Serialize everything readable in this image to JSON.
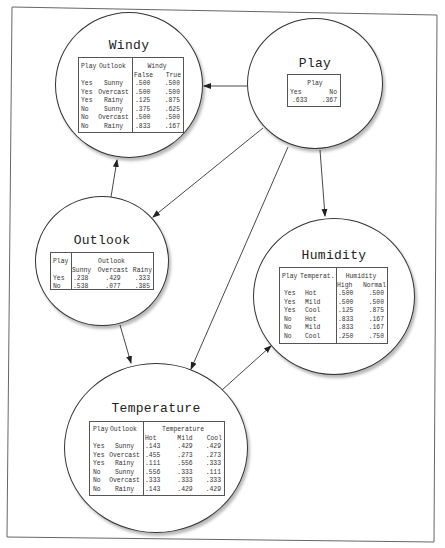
{
  "diagram": {
    "type": "bayesian-network",
    "nodes": {
      "windy": {
        "title": "Windy",
        "parents_header": [
          "Play",
          "Outlook"
        ],
        "variable": "Windy",
        "states": [
          "False",
          "True"
        ],
        "rows": [
          {
            "play": "Yes",
            "outlook": "Sunny",
            "values": [
              ".500",
              ".500"
            ]
          },
          {
            "play": "Yes",
            "outlook": "Overcast",
            "values": [
              ".500",
              ".500"
            ]
          },
          {
            "play": "Yes",
            "outlook": "Rainy",
            "values": [
              ".125",
              ".875"
            ]
          },
          {
            "play": "No",
            "outlook": "Sunny",
            "values": [
              ".375",
              ".625"
            ]
          },
          {
            "play": "No",
            "outlook": "Overcast",
            "values": [
              ".500",
              ".500"
            ]
          },
          {
            "play": "No",
            "outlook": "Rainy",
            "values": [
              ".833",
              ".167"
            ]
          }
        ]
      },
      "play": {
        "title": "Play",
        "variable": "Play",
        "states": [
          "Yes",
          "No"
        ],
        "values": [
          ".633",
          ".367"
        ]
      },
      "outlook": {
        "title": "Outlook",
        "parents_header": [
          "Play"
        ],
        "variable": "Outlook",
        "states": [
          "Sunny",
          "Overcast",
          "Rainy"
        ],
        "rows": [
          {
            "play": "Yes",
            "values": [
              ".238",
              ".429",
              ".333"
            ]
          },
          {
            "play": "No",
            "values": [
              ".538",
              ".077",
              ".385"
            ]
          }
        ]
      },
      "humidity": {
        "title": "Humidity",
        "parents_header": [
          "Play",
          "Temperat."
        ],
        "variable": "Humidity",
        "states": [
          "High",
          "Normal"
        ],
        "rows": [
          {
            "play": "Yes",
            "temp": "Hot",
            "values": [
              ".500",
              ".500"
            ]
          },
          {
            "play": "Yes",
            "temp": "Mild",
            "values": [
              ".500",
              ".500"
            ]
          },
          {
            "play": "Yes",
            "temp": "Cool",
            "values": [
              ".125",
              ".875"
            ]
          },
          {
            "play": "No",
            "temp": "Hot",
            "values": [
              ".833",
              ".167"
            ]
          },
          {
            "play": "No",
            "temp": "Mild",
            "values": [
              ".833",
              ".167"
            ]
          },
          {
            "play": "No",
            "temp": "Cool",
            "values": [
              ".250",
              ".750"
            ]
          }
        ]
      },
      "temperature": {
        "title": "Temperature",
        "parents_header": [
          "Play",
          "Outlook"
        ],
        "variable": "Temperature",
        "states": [
          "Hot",
          "Mild",
          "Cool"
        ],
        "rows": [
          {
            "play": "Yes",
            "outlook": "Sunny",
            "values": [
              ".143",
              ".429",
              ".429"
            ]
          },
          {
            "play": "Yes",
            "outlook": "Overcast",
            "values": [
              ".455",
              ".273",
              ".273"
            ]
          },
          {
            "play": "Yes",
            "outlook": "Rainy",
            "values": [
              ".111",
              ".556",
              ".333"
            ]
          },
          {
            "play": "No",
            "outlook": "Sunny",
            "values": [
              ".556",
              ".333",
              ".111"
            ]
          },
          {
            "play": "No",
            "outlook": "Overcast",
            "values": [
              ".333",
              ".333",
              ".333"
            ]
          },
          {
            "play": "No",
            "outlook": "Rainy",
            "values": [
              ".143",
              ".429",
              ".429"
            ]
          }
        ]
      }
    },
    "edges": [
      {
        "from": "Play",
        "to": "Windy"
      },
      {
        "from": "Outlook",
        "to": "Windy"
      },
      {
        "from": "Play",
        "to": "Outlook"
      },
      {
        "from": "Play",
        "to": "Temperature"
      },
      {
        "from": "Play",
        "to": "Humidity"
      },
      {
        "from": "Outlook",
        "to": "Temperature"
      },
      {
        "from": "Temperature",
        "to": "Humidity"
      }
    ],
    "colors": {
      "line": "#333333",
      "background": "#ffffff",
      "text": "#222222"
    }
  }
}
